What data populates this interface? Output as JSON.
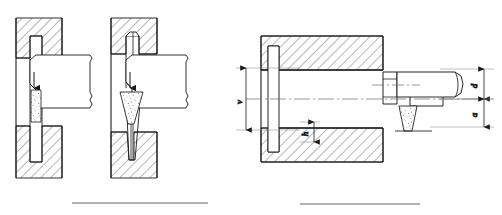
{
  "figure": {
    "type": "engineering-cross-section-drawing",
    "background_color": "#ffffff",
    "line_color": "#1a1a1a",
    "hatch_color": "#555555",
    "stipple_color": "#6b6b6b",
    "width": 502,
    "height": 215
  },
  "views": [
    {
      "id": "view-a",
      "name": "left-view",
      "description": "Die cavity with straight cylindrical billet and punch, arrow showing downward force",
      "arrow_direction": "down"
    },
    {
      "id": "view-b",
      "name": "middle-view",
      "description": "Die cavity with tapered (conical) billet and punch, arrow showing downward force",
      "arrow_direction": "down"
    },
    {
      "id": "view-c",
      "name": "right-view",
      "description": "Horizontal sectional assembly: hatched die block, shaft, flange disc, hex collar, punch rod with break line and tapered detail"
    }
  ],
  "dimensions": [
    {
      "id": "dim-v",
      "label": "v",
      "view": "right-view",
      "position": "left",
      "orientation": "vertical",
      "rotated": true
    },
    {
      "id": "dim-h",
      "label": "h",
      "view": "right-view",
      "position": "bottom-center",
      "orientation": "vertical",
      "rotated": true
    },
    {
      "id": "dim-d",
      "label": "d",
      "view": "right-view",
      "position": "right-upper",
      "orientation": "vertical",
      "rotated": true
    },
    {
      "id": "dim-a",
      "label": "a",
      "view": "right-view",
      "position": "right-lower",
      "orientation": "vertical",
      "rotated": true
    }
  ],
  "separators": [
    {
      "id": "separator-left",
      "x1": 72,
      "x2": 208,
      "y": 203
    },
    {
      "id": "separator-right",
      "x1": 300,
      "x2": 420,
      "y": 204
    }
  ]
}
